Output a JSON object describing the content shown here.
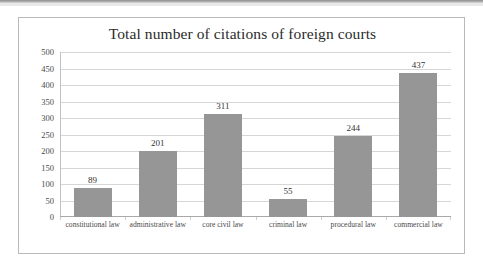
{
  "chart_data": {
    "type": "bar",
    "title": "Total number of citations of foreign courts",
    "xlabel": "",
    "ylabel": "",
    "categories": [
      "constitutional law",
      "administrative law",
      "core civil law",
      "criminal law",
      "procedural law",
      "commercial law"
    ],
    "values": [
      89,
      201,
      311,
      55,
      244,
      437
    ],
    "value_labels": [
      "89",
      "201",
      "311",
      "55",
      "244",
      "437"
    ],
    "ylim": [
      0,
      500
    ],
    "ytick_step": 50,
    "yticks": [
      500,
      450,
      400,
      350,
      300,
      250,
      200,
      150,
      100,
      50,
      0
    ],
    "ytick_labels": [
      "500",
      "450",
      "400",
      "350",
      "300",
      "250",
      "200",
      "150",
      "100",
      "50",
      "0"
    ],
    "grid": true,
    "legend": false,
    "legend_position": "none",
    "series": [
      {
        "name": "Total number of citations of foreign courts",
        "values": [
          89,
          201,
          311,
          55,
          244,
          437
        ]
      }
    ],
    "colors": {
      "bar_fill": "#969696",
      "gridline": "#d6d6d6",
      "axis": "#a9a9a9",
      "frame_border": "#b9b9b9",
      "title_text": "#2b2b2b",
      "tick_text": "#4a4a4a",
      "value_text": "#333333",
      "background": "#ffffff"
    }
  }
}
